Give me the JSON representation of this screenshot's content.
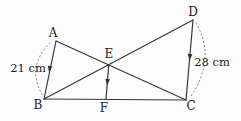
{
  "diagram": {
    "points": {
      "A": {
        "label": "A"
      },
      "B": {
        "label": "B"
      },
      "C": {
        "label": "C"
      },
      "D": {
        "label": "D"
      },
      "E": {
        "label": "E"
      },
      "F": {
        "label": "F"
      }
    },
    "measurements": {
      "left": "21 cm",
      "right": "28 cm"
    },
    "segments": [
      "A-B",
      "B-C",
      "D-C",
      "A-C",
      "B-D",
      "E-F"
    ],
    "markers": [
      "arrow-down-on-AB",
      "arrow-down-on-DC",
      "arrow-down-on-EF"
    ],
    "arcs": [
      "dotted-arc-A-to-B-left",
      "dotted-arc-D-to-C-right"
    ],
    "colors": {
      "line": "#383838",
      "arc_dots": "#6f6f6f",
      "text": "#1c1c1c",
      "background": "#fcfcfc"
    }
  }
}
